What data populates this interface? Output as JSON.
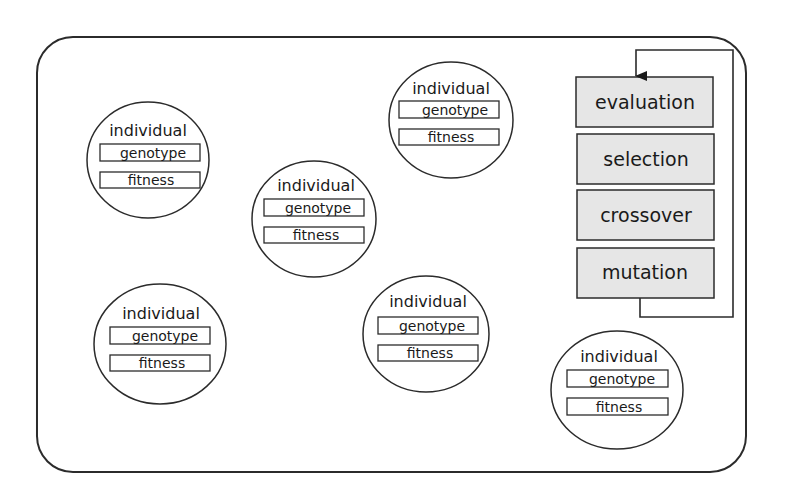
{
  "diagram": {
    "title": "",
    "container": {
      "x": 37,
      "y": 37,
      "width": 709,
      "height": 435,
      "radius": 36
    },
    "individuals": [
      {
        "cx": 148,
        "cy": 160,
        "rx": 61,
        "ry": 58,
        "label": "individual",
        "genotype": "genotype",
        "fitness": "fitness"
      },
      {
        "cx": 314,
        "cy": 219,
        "rx": 62,
        "ry": 58,
        "label": "individual",
        "genotype": "genotype",
        "fitness": "fitness"
      },
      {
        "cx": 451,
        "cy": 120,
        "rx": 62,
        "ry": 58,
        "label": "individual",
        "genotype": "genotype",
        "fitness": "fitness"
      },
      {
        "cx": 160,
        "cy": 344,
        "rx": 66,
        "ry": 60,
        "label": "individual",
        "genotype": "genotype",
        "fitness": "fitness"
      },
      {
        "cx": 426,
        "cy": 334,
        "rx": 63,
        "ry": 58,
        "label": "individual",
        "genotype": "genotype",
        "fitness": "fitness"
      },
      {
        "cx": 617,
        "cy": 390,
        "rx": 66,
        "ry": 59,
        "label": "individual",
        "genotype": "genotype",
        "fitness": "fitness"
      }
    ],
    "process_steps": [
      {
        "label": "evaluation"
      },
      {
        "label": "selection"
      },
      {
        "label": "crossover"
      },
      {
        "label": "mutation"
      }
    ],
    "loop": {
      "description": "arrow from mutation back to evaluation"
    },
    "colors": {
      "stroke": "#2b2b2b",
      "step_fill": "#e6e6e6",
      "background": "#ffffff"
    }
  }
}
